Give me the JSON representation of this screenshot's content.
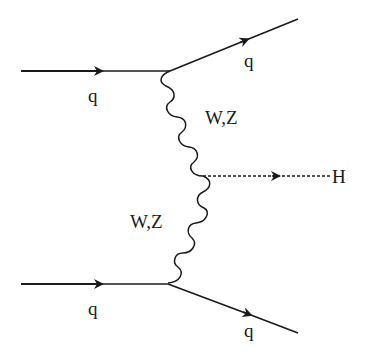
{
  "diagram": {
    "colors": {
      "line": "#1a1a1a",
      "background": "#ffffff"
    },
    "particles": {
      "incoming_top": {
        "label": "q",
        "type": "fermion"
      },
      "outgoing_top": {
        "label": "q",
        "type": "fermion"
      },
      "incoming_bottom": {
        "label": "q",
        "type": "fermion"
      },
      "outgoing_bottom": {
        "label": "q",
        "type": "fermion"
      },
      "boson_top": {
        "label": "W,Z",
        "type": "vector-boson"
      },
      "boson_bottom": {
        "label": "W,Z",
        "type": "vector-boson"
      },
      "higgs": {
        "label": "H",
        "type": "scalar"
      }
    }
  }
}
